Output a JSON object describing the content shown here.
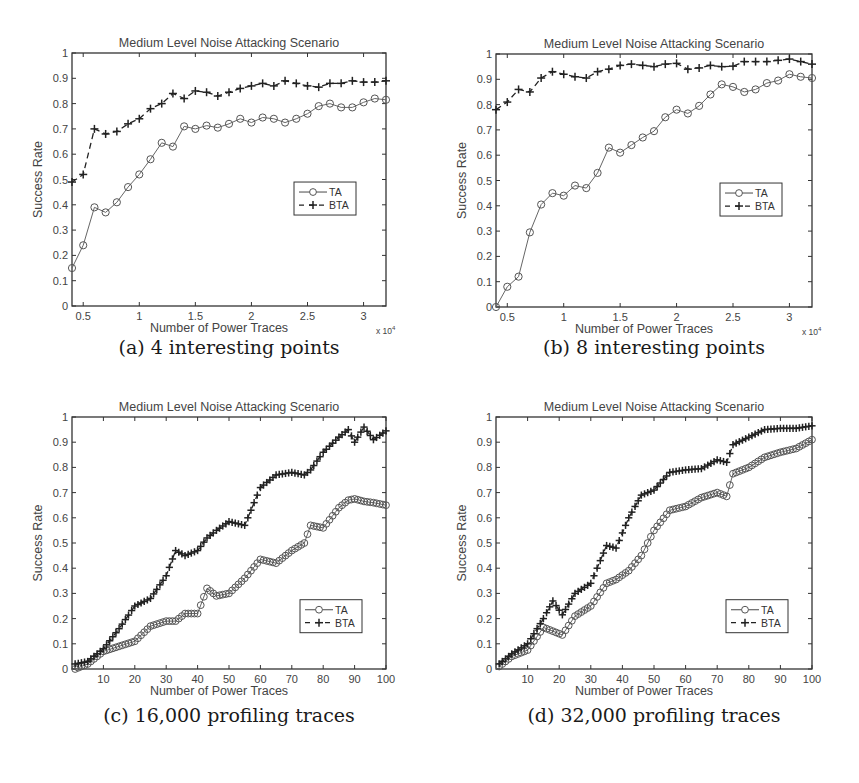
{
  "figure": {
    "panels": [
      {
        "id": "a",
        "caption": "(a) 4 interesting points"
      },
      {
        "id": "b",
        "caption": "(b) 8 interesting points"
      },
      {
        "id": "c",
        "caption": "(c) 16,000 profiling traces"
      },
      {
        "id": "d",
        "caption": "(d) 32,000 profiling traces"
      }
    ]
  },
  "chart_data": [
    {
      "id": "a",
      "type": "line",
      "title": "Medium Level Noise Attacking Scenario",
      "xlabel": "Number of Power Traces",
      "ylabel": "Success Rate",
      "x_multiplier": "x 10^4",
      "x_multiplier_label": "x 10",
      "x_multiplier_exp": "4",
      "xlim": [
        0.4,
        3.2
      ],
      "ylim": [
        0,
        1
      ],
      "xticks": [
        0.5,
        1,
        1.5,
        2,
        2.5,
        3
      ],
      "xtick_labels": [
        "0.5",
        "1",
        "1.5",
        "2",
        "2.5",
        "3"
      ],
      "yticks": [
        0,
        0.1,
        0.2,
        0.3,
        0.4,
        0.5,
        0.6,
        0.7,
        0.8,
        0.9,
        1
      ],
      "ytick_labels": [
        "0",
        "0.1",
        "0.2",
        "0.3",
        "0.4",
        "0.5",
        "0.6",
        "0.7",
        "0.8",
        "0.9",
        "1"
      ],
      "grid": false,
      "legend_position": "right-middle",
      "x": [
        0.4,
        0.5,
        0.6,
        0.7,
        0.8,
        0.9,
        1.0,
        1.1,
        1.2,
        1.3,
        1.4,
        1.5,
        1.6,
        1.7,
        1.8,
        1.9,
        2.0,
        2.1,
        2.2,
        2.3,
        2.4,
        2.5,
        2.6,
        2.7,
        2.8,
        2.9,
        3.0,
        3.1,
        3.2
      ],
      "series": [
        {
          "name": "TA",
          "style": "solid-circle",
          "values": [
            0.15,
            0.24,
            0.39,
            0.37,
            0.41,
            0.47,
            0.52,
            0.58,
            0.645,
            0.63,
            0.71,
            0.7,
            0.713,
            0.705,
            0.72,
            0.74,
            0.725,
            0.745,
            0.74,
            0.725,
            0.74,
            0.76,
            0.79,
            0.8,
            0.785,
            0.785,
            0.805,
            0.82,
            0.815
          ]
        },
        {
          "name": "BTA",
          "style": "dashed-plus",
          "values": [
            0.49,
            0.52,
            0.7,
            0.68,
            0.69,
            0.72,
            0.74,
            0.78,
            0.8,
            0.84,
            0.82,
            0.85,
            0.845,
            0.83,
            0.845,
            0.86,
            0.87,
            0.88,
            0.87,
            0.89,
            0.88,
            0.87,
            0.865,
            0.88,
            0.88,
            0.89,
            0.885,
            0.885,
            0.89
          ]
        }
      ]
    },
    {
      "id": "b",
      "type": "line",
      "title": "Medium Level Noise Attacking Scenario",
      "xlabel": "Number of Power Traces",
      "ylabel": "Success Rate",
      "x_multiplier": "x 10^4",
      "x_multiplier_label": "x 10",
      "x_multiplier_exp": "4",
      "xlim": [
        0.4,
        3.2
      ],
      "ylim": [
        0,
        1
      ],
      "xticks": [
        0.5,
        1,
        1.5,
        2,
        2.5,
        3
      ],
      "xtick_labels": [
        "0.5",
        "1",
        "1.5",
        "2",
        "2.5",
        "3"
      ],
      "yticks": [
        0,
        0.1,
        0.2,
        0.3,
        0.4,
        0.5,
        0.6,
        0.7,
        0.8,
        0.9,
        1
      ],
      "ytick_labels": [
        "0",
        "0.1",
        "0.2",
        "0.3",
        "0.4",
        "0.5",
        "0.6",
        "0.7",
        "0.8",
        "0.9",
        "1"
      ],
      "grid": false,
      "legend_position": "right-middle",
      "x": [
        0.4,
        0.5,
        0.6,
        0.7,
        0.8,
        0.9,
        1.0,
        1.1,
        1.2,
        1.3,
        1.4,
        1.5,
        1.6,
        1.7,
        1.8,
        1.9,
        2.0,
        2.1,
        2.2,
        2.3,
        2.4,
        2.5,
        2.6,
        2.7,
        2.8,
        2.9,
        3.0,
        3.1,
        3.2
      ],
      "series": [
        {
          "name": "TA",
          "style": "solid-circle",
          "values": [
            0.0,
            0.08,
            0.12,
            0.295,
            0.405,
            0.45,
            0.44,
            0.48,
            0.47,
            0.53,
            0.63,
            0.61,
            0.64,
            0.67,
            0.695,
            0.75,
            0.78,
            0.765,
            0.795,
            0.84,
            0.88,
            0.87,
            0.85,
            0.86,
            0.885,
            0.895,
            0.92,
            0.91,
            0.905
          ]
        },
        {
          "name": "BTA",
          "style": "dashed-plus",
          "values": [
            0.78,
            0.81,
            0.86,
            0.85,
            0.905,
            0.93,
            0.92,
            0.91,
            0.905,
            0.93,
            0.94,
            0.955,
            0.96,
            0.955,
            0.95,
            0.96,
            0.963,
            0.94,
            0.945,
            0.955,
            0.95,
            0.952,
            0.97,
            0.97,
            0.97,
            0.975,
            0.98,
            0.97,
            0.96
          ]
        }
      ]
    },
    {
      "id": "c",
      "type": "line",
      "title": "Medium Level Noise Attacking Scenario",
      "xlabel": "Number of Power Traces",
      "ylabel": "Success Rate",
      "xlim": [
        0,
        100
      ],
      "ylim": [
        0,
        1
      ],
      "xticks": [
        10,
        20,
        30,
        40,
        50,
        60,
        70,
        80,
        90,
        100
      ],
      "xtick_labels": [
        "10",
        "20",
        "30",
        "40",
        "50",
        "60",
        "70",
        "80",
        "90",
        "100"
      ],
      "yticks": [
        0,
        0.1,
        0.2,
        0.3,
        0.4,
        0.5,
        0.6,
        0.7,
        0.8,
        0.9,
        1
      ],
      "ytick_labels": [
        "0",
        "0.1",
        "0.2",
        "0.3",
        "0.4",
        "0.5",
        "0.6",
        "0.7",
        "0.8",
        "0.9",
        "1"
      ],
      "grid": false,
      "legend_position": "lower-right",
      "x": [
        1,
        5,
        10,
        15,
        20,
        25,
        30,
        33,
        36,
        40,
        43,
        46,
        50,
        55,
        60,
        65,
        70,
        74,
        76,
        80,
        85,
        88,
        90,
        93,
        96,
        100
      ],
      "series": [
        {
          "name": "TA",
          "style": "solid-circle",
          "values": [
            0.0,
            0.02,
            0.07,
            0.09,
            0.11,
            0.17,
            0.19,
            0.19,
            0.22,
            0.22,
            0.32,
            0.29,
            0.3,
            0.36,
            0.435,
            0.42,
            0.47,
            0.5,
            0.57,
            0.56,
            0.64,
            0.67,
            0.675,
            0.665,
            0.66,
            0.65
          ]
        },
        {
          "name": "BTA",
          "style": "dashed-plus",
          "values": [
            0.02,
            0.03,
            0.08,
            0.16,
            0.25,
            0.28,
            0.37,
            0.47,
            0.45,
            0.47,
            0.52,
            0.55,
            0.585,
            0.57,
            0.72,
            0.77,
            0.78,
            0.77,
            0.79,
            0.86,
            0.92,
            0.95,
            0.9,
            0.96,
            0.91,
            0.945
          ]
        }
      ]
    },
    {
      "id": "d",
      "type": "line",
      "title": "Medium Level Noise Attacking Scenario",
      "xlabel": "Number of Power Traces",
      "ylabel": "Success Rate",
      "xlim": [
        0,
        100
      ],
      "ylim": [
        0,
        1
      ],
      "xticks": [
        10,
        20,
        30,
        40,
        50,
        60,
        70,
        80,
        90,
        100
      ],
      "xtick_labels": [
        "10",
        "20",
        "30",
        "40",
        "50",
        "60",
        "70",
        "80",
        "90",
        "100"
      ],
      "yticks": [
        0,
        0.1,
        0.2,
        0.3,
        0.4,
        0.5,
        0.6,
        0.7,
        0.8,
        0.9,
        1
      ],
      "ytick_labels": [
        "0",
        "0.1",
        "0.2",
        "0.3",
        "0.4",
        "0.5",
        "0.6",
        "0.7",
        "0.8",
        "0.9",
        "1"
      ],
      "grid": false,
      "legend_position": "lower-right",
      "x": [
        1,
        5,
        10,
        15,
        18,
        21,
        25,
        30,
        35,
        38,
        42,
        46,
        50,
        55,
        60,
        65,
        70,
        73,
        75,
        80,
        85,
        90,
        95,
        100
      ],
      "series": [
        {
          "name": "TA",
          "style": "solid-circle",
          "values": [
            0.01,
            0.05,
            0.075,
            0.165,
            0.15,
            0.135,
            0.21,
            0.25,
            0.34,
            0.355,
            0.39,
            0.45,
            0.55,
            0.63,
            0.645,
            0.68,
            0.7,
            0.685,
            0.775,
            0.8,
            0.84,
            0.86,
            0.875,
            0.91
          ]
        },
        {
          "name": "BTA",
          "style": "dashed-plus",
          "values": [
            0.02,
            0.06,
            0.1,
            0.2,
            0.27,
            0.215,
            0.3,
            0.34,
            0.49,
            0.48,
            0.6,
            0.69,
            0.71,
            0.78,
            0.79,
            0.795,
            0.83,
            0.82,
            0.89,
            0.92,
            0.95,
            0.955,
            0.955,
            0.965
          ]
        }
      ]
    }
  ]
}
